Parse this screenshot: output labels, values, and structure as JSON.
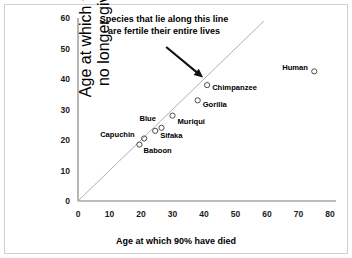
{
  "chart_data": {
    "type": "scatter",
    "title": "",
    "xlabel": "Age at which 90% have died",
    "ylabel": "Age at which 90% can no longer give birth",
    "ylabel_lines": [
      "Age at which 90% can",
      "no longer give birth"
    ],
    "xlim": [
      0,
      80
    ],
    "ylim": [
      0,
      60
    ],
    "xticks": [
      0,
      10,
      20,
      30,
      40,
      50,
      60,
      70,
      80
    ],
    "yticks": [
      0,
      10,
      20,
      30,
      40,
      50,
      60
    ],
    "grid": false,
    "legend": "none",
    "marker": "open-circle",
    "points": [
      {
        "label": "Baboon",
        "x": 19.5,
        "y": 18.5
      },
      {
        "label": "Capuchin",
        "x": 21.0,
        "y": 20.5
      },
      {
        "label": "Sifaka",
        "x": 24.5,
        "y": 23.0
      },
      {
        "label": "Blue",
        "x": 26.5,
        "y": 24.0
      },
      {
        "label": "Muriqui",
        "x": 30.0,
        "y": 28.0
      },
      {
        "label": "Gorilla",
        "x": 38.0,
        "y": 33.0
      },
      {
        "label": "Chimpanzee",
        "x": 41.0,
        "y": 38.0
      },
      {
        "label": "Human",
        "x": 75.0,
        "y": 42.5
      }
    ],
    "reference_line": {
      "description": "y = x identity line",
      "from": [
        0,
        0
      ],
      "to": [
        59,
        59
      ],
      "color": "#b0b0b0"
    },
    "annotations": [
      {
        "name": "fertility-line-note",
        "lines": [
          "Species that lie along this line",
          "are fertile their entire lives"
        ],
        "arrow_from": [
          28,
          50.5
        ],
        "arrow_to": [
          38.5,
          41.5
        ]
      }
    ]
  },
  "label_offsets": {
    "Baboon": {
      "dx": 4,
      "dy": 6
    },
    "Capuchin": {
      "dx": -44,
      "dy": -3
    },
    "Sifaka": {
      "dx": 5,
      "dy": 5
    },
    "Blue": {
      "dx": -22,
      "dy": -9
    },
    "Muriqui": {
      "dx": 5,
      "dy": 6
    },
    "Gorilla": {
      "dx": 5,
      "dy": 5
    },
    "Chimpanzee": {
      "dx": 5,
      "dy": 3
    },
    "Human": {
      "dx": -32,
      "dy": -3
    }
  },
  "colors": {
    "axis": "#7a7a7a",
    "reference_line": "#b5b5b5",
    "marker_stroke": "#3a3a3a",
    "text": "#000000",
    "frame": "#cfcfcf",
    "background": "#ffffff"
  }
}
